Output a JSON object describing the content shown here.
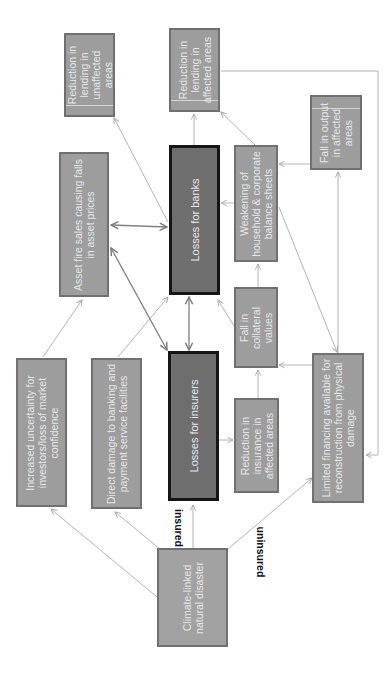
{
  "diagram": {
    "orientation": "rotated-90-ccw",
    "nodes": [
      {
        "id": "lending-unaffected",
        "label": "Reduction in lending in unaffected areas"
      },
      {
        "id": "lending-affected",
        "label": "Reduction in lending in affected areas"
      },
      {
        "id": "fall-output",
        "label": "Fall in output in affected areas"
      },
      {
        "id": "asset-fire-sales",
        "label": "Asset fire sales causing falls in asset prices"
      },
      {
        "id": "losses-banks",
        "label": "Losses for banks"
      },
      {
        "id": "weakening-balance",
        "label": "Weakening of household & corporate balance sheets"
      },
      {
        "id": "fall-collateral",
        "label": "Fall in collateral values"
      },
      {
        "id": "increased-uncertainty",
        "label": "Increased uncertainty for investors/loss of market confidence"
      },
      {
        "id": "direct-damage",
        "label": "Direct damage to banking and payment service facilities"
      },
      {
        "id": "losses-insurers",
        "label": "Losses for insurers"
      },
      {
        "id": "reduction-insurance",
        "label": "Reduction in insurance in affected areas"
      },
      {
        "id": "limited-financing",
        "label": "Limited financing available for reconstruction from physical damage"
      },
      {
        "id": "climate-disaster",
        "label": "Climate-linked natural disaster"
      }
    ],
    "edge_labels": {
      "insured": "insured",
      "uninsured": "uninsured"
    },
    "edges": [
      {
        "from": "climate-disaster",
        "to": "increased-uncertainty"
      },
      {
        "from": "climate-disaster",
        "to": "direct-damage"
      },
      {
        "from": "climate-disaster",
        "to": "losses-insurers",
        "label": "insured"
      },
      {
        "from": "climate-disaster",
        "to": "limited-financing",
        "label": "uninsured"
      },
      {
        "from": "increased-uncertainty",
        "to": "asset-fire-sales"
      },
      {
        "from": "direct-damage",
        "to": "losses-banks"
      },
      {
        "from": "losses-insurers",
        "to": "losses-banks",
        "bidirectional": true
      },
      {
        "from": "losses-insurers",
        "to": "asset-fire-sales",
        "bidirectional": true
      },
      {
        "from": "asset-fire-sales",
        "to": "losses-banks",
        "bidirectional": true
      },
      {
        "from": "losses-insurers",
        "to": "reduction-insurance"
      },
      {
        "from": "reduction-insurance",
        "to": "fall-collateral"
      },
      {
        "from": "fall-collateral",
        "to": "losses-banks"
      },
      {
        "from": "fall-collateral",
        "to": "weakening-balance"
      },
      {
        "from": "limited-financing",
        "to": "fall-collateral"
      },
      {
        "from": "limited-financing",
        "to": "fall-output"
      },
      {
        "from": "fall-output",
        "to": "weakening-balance"
      },
      {
        "from": "weakening-balance",
        "to": "losses-banks"
      },
      {
        "from": "weakening-balance",
        "to": "lending-affected"
      },
      {
        "from": "weakening-balance",
        "to": "limited-financing"
      },
      {
        "from": "losses-banks",
        "to": "lending-affected"
      },
      {
        "from": "losses-banks",
        "to": "lending-unaffected"
      },
      {
        "from": "lending-affected",
        "to": "limited-financing"
      }
    ]
  }
}
